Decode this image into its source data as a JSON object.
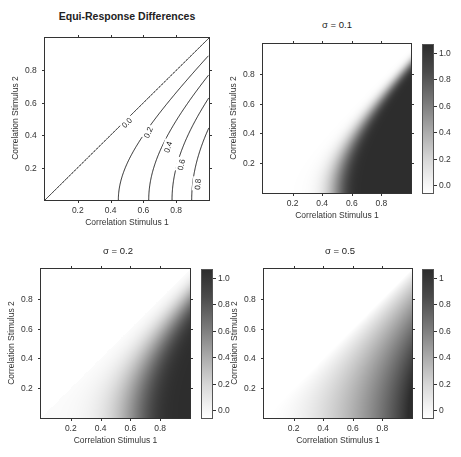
{
  "figure": {
    "panels": [
      {
        "id": "p1",
        "title": "Equi-Response Differences",
        "title_bold": true,
        "xlabel": "Correlation Stimulus 1",
        "ylabel": "Correlation Stimulus 2",
        "type": "contour",
        "box": {
          "x": 45,
          "y": 38,
          "w": 164,
          "h": 162
        },
        "title_pos": {
          "x": 127,
          "y": 10
        },
        "ticks": [
          "0.2",
          "0.4",
          "0.6",
          "0.8"
        ]
      },
      {
        "id": "p2",
        "title": "σ = 0.1",
        "xlabel": "Correlation Stimulus 1",
        "ylabel": "Correlation Stimulus 2",
        "type": "heatmap",
        "sigma": 0.1,
        "box": {
          "x": 263,
          "y": 44,
          "w": 148,
          "h": 149
        },
        "title_pos": {
          "x": 337,
          "y": 19
        },
        "cbar": {
          "x": 422,
          "y": 44,
          "w": 12,
          "h": 150
        },
        "cbar_ticks": [
          "0.0",
          "0.2",
          "0.4",
          "0.6",
          "0.8",
          "1.0"
        ],
        "ticks": [
          "0.2",
          "0.4",
          "0.6",
          "0.8"
        ]
      },
      {
        "id": "p3",
        "title": "σ = 0.2",
        "xlabel": "Correlation Stimulus 1",
        "ylabel": "Correlation Stimulus 2",
        "type": "heatmap",
        "sigma": 0.2,
        "box": {
          "x": 41,
          "y": 269,
          "w": 149,
          "h": 149
        },
        "title_pos": {
          "x": 118,
          "y": 245
        },
        "cbar": {
          "x": 201,
          "y": 269,
          "w": 12,
          "h": 150
        },
        "cbar_ticks": [
          "0.0",
          "0.2",
          "0.4",
          "0.6",
          "0.8",
          "1.0"
        ],
        "ticks": [
          "0.2",
          "0.4",
          "0.6",
          "0.8"
        ]
      },
      {
        "id": "p4",
        "title": "σ = 0.5",
        "xlabel": "Correlation Stimulus 1",
        "ylabel": "Correlation Stimulus 2",
        "type": "heatmap",
        "sigma": 0.5,
        "box": {
          "x": 264,
          "y": 269,
          "w": 148,
          "h": 149
        },
        "title_pos": {
          "x": 340,
          "y": 245
        },
        "cbar": {
          "x": 422,
          "y": 269,
          "w": 12,
          "h": 150
        },
        "cbar_ticks": [
          "0",
          "0.2",
          "0.4",
          "0.6",
          "0.8",
          "1"
        ],
        "ticks": [
          "0.2",
          "0.4",
          "0.6",
          "0.8"
        ]
      }
    ]
  },
  "chart_data": [
    {
      "type": "line",
      "title": "Equi-Response Differences",
      "xlabel": "Correlation Stimulus 1",
      "ylabel": "Correlation Stimulus 2",
      "xlim": [
        0,
        1
      ],
      "ylim": [
        0,
        1
      ],
      "grid": false,
      "contour_function": "x^2 - y^2",
      "contour_levels": [
        0.0,
        0.2,
        0.4,
        0.6,
        0.8
      ],
      "contour_labels": [
        "0.0",
        "0.2",
        "0.4",
        "0.6",
        "0.8"
      ],
      "x_intercepts": {
        "0.0": 0.0,
        "0.2": 0.45,
        "0.4": 0.63,
        "0.6": 0.77,
        "0.8": 0.9
      },
      "right_edge_y": {
        "0.0": 1.0,
        "0.2": 0.89,
        "0.4": 0.77,
        "0.6": 0.63,
        "0.8": 0.45
      }
    },
    {
      "type": "heatmap",
      "title": "σ = 0.1",
      "xlabel": "Correlation Stimulus 1",
      "ylabel": "Correlation Stimulus 2",
      "xlim": [
        0,
        1
      ],
      "ylim": [
        0,
        1
      ],
      "sigma": 0.1,
      "value_range": [
        0,
        1
      ],
      "colorbar_ticks": [
        0.0,
        0.2,
        0.4,
        0.6,
        0.8,
        1.0
      ],
      "region": "x > y",
      "colormap": "white-to-dark-gray"
    },
    {
      "type": "heatmap",
      "title": "σ = 0.2",
      "xlabel": "Correlation Stimulus 1",
      "ylabel": "Correlation Stimulus 2",
      "xlim": [
        0,
        1
      ],
      "ylim": [
        0,
        1
      ],
      "sigma": 0.2,
      "value_range": [
        0,
        1
      ],
      "colorbar_ticks": [
        0.0,
        0.2,
        0.4,
        0.6,
        0.8,
        1.0
      ],
      "region": "x > y",
      "colormap": "white-to-dark-gray"
    },
    {
      "type": "heatmap",
      "title": "σ = 0.5",
      "xlabel": "Correlation Stimulus 1",
      "ylabel": "Correlation Stimulus 2",
      "xlim": [
        0,
        1
      ],
      "ylim": [
        0,
        1
      ],
      "sigma": 0.5,
      "value_range": [
        0,
        1
      ],
      "colorbar_ticks": [
        0,
        0.2,
        0.4,
        0.6,
        0.8,
        1
      ],
      "region": "x > y",
      "colormap": "white-to-dark-gray"
    }
  ]
}
